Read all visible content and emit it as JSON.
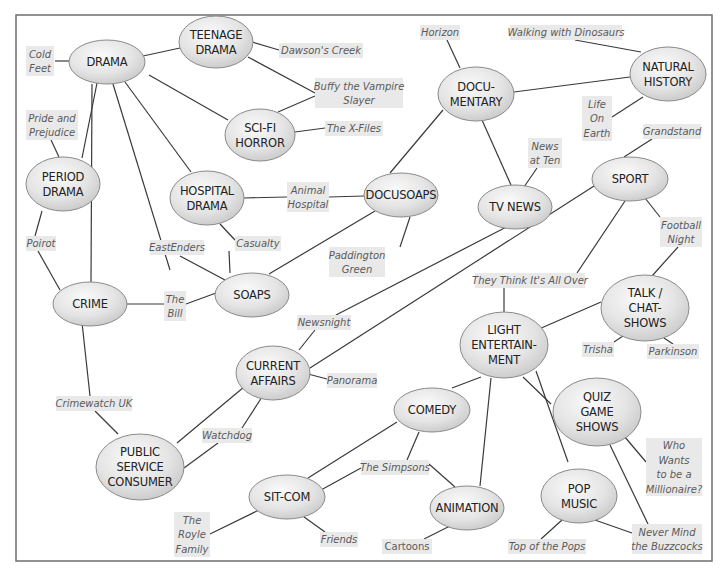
{
  "colors": {
    "frame": "#6e6e6e",
    "edge": "#3a3a3a",
    "node_light": "#fafafa",
    "node_dark": "#c8c8c8",
    "example_box": "#e9e9e9",
    "example_text": "#5a5a5a",
    "node_text": "#222222"
  },
  "frame": {
    "x": 16,
    "y": 15,
    "w": 696,
    "h": 546
  },
  "nodes": [
    {
      "id": "drama",
      "lines": [
        "DRAMA"
      ],
      "cx": 107,
      "cy": 62,
      "rx": 38,
      "ry": 22
    },
    {
      "id": "teenage-drama",
      "lines": [
        "TEENAGE",
        "DRAMA"
      ],
      "cx": 216,
      "cy": 42,
      "rx": 37,
      "ry": 26
    },
    {
      "id": "sci-fi-horror",
      "lines": [
        "SCI-FI",
        "HORROR"
      ],
      "cx": 260,
      "cy": 135,
      "rx": 35,
      "ry": 26
    },
    {
      "id": "period-drama",
      "lines": [
        "PERIOD",
        "DRAMA"
      ],
      "cx": 63,
      "cy": 184,
      "rx": 37,
      "ry": 27
    },
    {
      "id": "hospital-drama",
      "lines": [
        "HOSPITAL",
        "DRAMA"
      ],
      "cx": 207,
      "cy": 198,
      "rx": 37,
      "ry": 27
    },
    {
      "id": "docusoaps",
      "lines": [
        "DOCUSOAPS"
      ],
      "cx": 401,
      "cy": 195,
      "rx": 37,
      "ry": 22
    },
    {
      "id": "crime",
      "lines": [
        "CRIME"
      ],
      "cx": 90,
      "cy": 304,
      "rx": 37,
      "ry": 22
    },
    {
      "id": "soaps",
      "lines": [
        "SOAPS"
      ],
      "cx": 252,
      "cy": 295,
      "rx": 37,
      "ry": 22
    },
    {
      "id": "documentary",
      "lines": [
        "DOCU-",
        "MENTARY"
      ],
      "cx": 476,
      "cy": 94,
      "rx": 38,
      "ry": 27
    },
    {
      "id": "natural-history",
      "lines": [
        "NATURAL",
        "HISTORY"
      ],
      "cx": 668,
      "cy": 74,
      "rx": 38,
      "ry": 27
    },
    {
      "id": "tv-news",
      "lines": [
        "TV NEWS"
      ],
      "cx": 515,
      "cy": 207,
      "rx": 37,
      "ry": 22
    },
    {
      "id": "sport",
      "lines": [
        "SPORT"
      ],
      "cx": 630,
      "cy": 179,
      "rx": 38,
      "ry": 22
    },
    {
      "id": "talk-chat-shows",
      "lines": [
        "TALK /",
        "CHAT-",
        "SHOWS"
      ],
      "cx": 645,
      "cy": 308,
      "rx": 44,
      "ry": 33
    },
    {
      "id": "light-entertainment",
      "lines": [
        "LIGHT",
        "ENTERTAIN-",
        "MENT"
      ],
      "cx": 504,
      "cy": 345,
      "rx": 44,
      "ry": 33
    },
    {
      "id": "current-affairs",
      "lines": [
        "CURRENT",
        "AFFAIRS"
      ],
      "cx": 273,
      "cy": 373,
      "rx": 37,
      "ry": 27
    },
    {
      "id": "comedy",
      "lines": [
        "COMEDY"
      ],
      "cx": 432,
      "cy": 410,
      "rx": 38,
      "ry": 22
    },
    {
      "id": "quiz-game-shows",
      "lines": [
        "QUIZ",
        "GAME",
        "SHOWS"
      ],
      "cx": 597,
      "cy": 412,
      "rx": 44,
      "ry": 34
    },
    {
      "id": "public-service-consumer",
      "lines": [
        "PUBLIC",
        "SERVICE",
        "CONSUMER"
      ],
      "cx": 140,
      "cy": 467,
      "rx": 44,
      "ry": 33
    },
    {
      "id": "sit-com",
      "lines": [
        "SIT-COM"
      ],
      "cx": 287,
      "cy": 497,
      "rx": 38,
      "ry": 22
    },
    {
      "id": "animation",
      "lines": [
        "ANIMATION"
      ],
      "cx": 467,
      "cy": 508,
      "rx": 37,
      "ry": 22
    },
    {
      "id": "pop-music",
      "lines": [
        "POP",
        "MUSIC"
      ],
      "cx": 579,
      "cy": 496,
      "rx": 38,
      "ry": 27
    }
  ],
  "examples": [
    {
      "id": "cold-feet",
      "lines": [
        "Cold",
        "Feet"
      ],
      "x": 26,
      "y": 46,
      "w": 28,
      "h": 30
    },
    {
      "id": "pride-and-prejudice",
      "lines": [
        "Pride and",
        "Prejudice"
      ],
      "x": 26,
      "y": 110,
      "w": 52,
      "h": 30
    },
    {
      "id": "poirot",
      "lines": [
        "Poirot"
      ],
      "x": 26,
      "y": 236,
      "w": 30,
      "h": 15
    },
    {
      "id": "dawsons-creek",
      "lines": [
        "Dawson's Creek"
      ],
      "x": 279,
      "y": 43,
      "w": 84,
      "h": 15
    },
    {
      "id": "buffy-the-vampire-slayer",
      "lines": [
        "Buffy the Vampire",
        "Slayer"
      ],
      "x": 315,
      "y": 78,
      "w": 88,
      "h": 30
    },
    {
      "id": "the-x-files",
      "lines": [
        "The X-Files"
      ],
      "x": 325,
      "y": 121,
      "w": 58,
      "h": 15
    },
    {
      "id": "eastenders",
      "lines": [
        "EastEnders"
      ],
      "x": 150,
      "y": 240,
      "w": 54,
      "h": 15
    },
    {
      "id": "casualty",
      "lines": [
        "Casualty"
      ],
      "x": 235,
      "y": 236,
      "w": 46,
      "h": 15
    },
    {
      "id": "animal-hospital",
      "lines": [
        "Animal",
        "Hospital"
      ],
      "x": 287,
      "y": 182,
      "w": 42,
      "h": 30
    },
    {
      "id": "paddington-green",
      "lines": [
        "Paddington",
        "Green"
      ],
      "x": 329,
      "y": 247,
      "w": 56,
      "h": 30
    },
    {
      "id": "the-bill",
      "lines": [
        "The",
        "Bill"
      ],
      "x": 164,
      "y": 291,
      "w": 22,
      "h": 30
    },
    {
      "id": "horizon",
      "lines": [
        "Horizon"
      ],
      "x": 420,
      "y": 25,
      "w": 40,
      "h": 15
    },
    {
      "id": "walking-with-dinosaurs",
      "lines": [
        "Walking with Dinosaurs"
      ],
      "x": 510,
      "y": 25,
      "w": 112,
      "h": 15
    },
    {
      "id": "life-on-earth",
      "lines": [
        "Life",
        "On",
        "Earth"
      ],
      "x": 582,
      "y": 96,
      "w": 30,
      "h": 45
    },
    {
      "id": "news-at-ten",
      "lines": [
        "News",
        "at Ten"
      ],
      "x": 528,
      "y": 138,
      "w": 34,
      "h": 30
    },
    {
      "id": "grandstand",
      "lines": [
        "Grandstand"
      ],
      "x": 643,
      "y": 124,
      "w": 58,
      "h": 15
    },
    {
      "id": "football-night",
      "lines": [
        "Football",
        "Night"
      ],
      "x": 660,
      "y": 217,
      "w": 42,
      "h": 30
    },
    {
      "id": "newsnight",
      "lines": [
        "Newsnight"
      ],
      "x": 297,
      "y": 315,
      "w": 54,
      "h": 15
    },
    {
      "id": "they-think-its-all-over",
      "lines": [
        "They Think It's All Over"
      ],
      "x": 475,
      "y": 273,
      "w": 110,
      "h": 15
    },
    {
      "id": "trisha",
      "lines": [
        "Trisha"
      ],
      "x": 582,
      "y": 342,
      "w": 32,
      "h": 15
    },
    {
      "id": "parkinson",
      "lines": [
        "Parkinson"
      ],
      "x": 647,
      "y": 344,
      "w": 52,
      "h": 15
    },
    {
      "id": "panorama",
      "lines": [
        "Panorama"
      ],
      "x": 327,
      "y": 373,
      "w": 50,
      "h": 15
    },
    {
      "id": "crimewatch-uk",
      "lines": [
        "Crimewatch UK"
      ],
      "x": 56,
      "y": 396,
      "w": 76,
      "h": 15
    },
    {
      "id": "watchdog",
      "lines": [
        "Watchdog"
      ],
      "x": 202,
      "y": 428,
      "w": 50,
      "h": 15
    },
    {
      "id": "the-simpsons",
      "lines": [
        "The Simpsons"
      ],
      "x": 361,
      "y": 460,
      "w": 68,
      "h": 15
    },
    {
      "id": "who-wants-to-be-a-millionaire",
      "lines": [
        "Who",
        "Wants",
        "to be a",
        "Millionaire?"
      ],
      "x": 646,
      "y": 438,
      "w": 56,
      "h": 58
    },
    {
      "id": "the-royle-family",
      "lines": [
        "The",
        "Royle",
        "Family"
      ],
      "x": 174,
      "y": 512,
      "w": 36,
      "h": 45
    },
    {
      "id": "friends",
      "lines": [
        "Friends"
      ],
      "x": 320,
      "y": 532,
      "w": 38,
      "h": 15
    },
    {
      "id": "cartoons",
      "lines": [
        "Cartoons"
      ],
      "x": 382,
      "y": 539,
      "w": 50,
      "h": 15,
      "upright": true
    },
    {
      "id": "top-of-the-pops",
      "lines": [
        "Top of the Pops"
      ],
      "x": 508,
      "y": 539,
      "w": 78,
      "h": 15
    },
    {
      "id": "never-mind-the-buzzcocks",
      "lines": [
        "Never Mind",
        "the Buzzcocks"
      ],
      "x": 632,
      "y": 524,
      "w": 70,
      "h": 30
    }
  ],
  "edges": [
    [
      55,
      61,
      69,
      61
    ],
    [
      143,
      56,
      180,
      48
    ],
    [
      149,
      75,
      228,
      120
    ],
    [
      97,
      83,
      82,
      158
    ],
    [
      92,
      84,
      91,
      282
    ],
    [
      113,
      84,
      170,
      270
    ],
    [
      125,
      82,
      191,
      172
    ],
    [
      51,
      140,
      59,
      157
    ],
    [
      252,
      42,
      279,
      50
    ],
    [
      248,
      57,
      315,
      93
    ],
    [
      278,
      112,
      315,
      96
    ],
    [
      295,
      132,
      325,
      128
    ],
    [
      42,
      211,
      35,
      236
    ],
    [
      38,
      251,
      60,
      290
    ],
    [
      244,
      198,
      287,
      197
    ],
    [
      329,
      197,
      364,
      196
    ],
    [
      220,
      224,
      235,
      240
    ],
    [
      229,
      251,
      230,
      273
    ],
    [
      180,
      256,
      225,
      280
    ],
    [
      127,
      304,
      164,
      304
    ],
    [
      186,
      304,
      216,
      293
    ],
    [
      269,
      274,
      375,
      211
    ],
    [
      410,
      217,
      400,
      247
    ],
    [
      390,
      173,
      443,
      110
    ],
    [
      447,
      40,
      460,
      68
    ],
    [
      575,
      40,
      641,
      52
    ],
    [
      514,
      92,
      630,
      77
    ],
    [
      612,
      117,
      643,
      97
    ],
    [
      482,
      120,
      511,
      185
    ],
    [
      524,
      187,
      537,
      168
    ],
    [
      652,
      139,
      624,
      157
    ],
    [
      625,
      201,
      577,
      273
    ],
    [
      645,
      198,
      660,
      217
    ],
    [
      678,
      247,
      652,
      276
    ],
    [
      539,
      329,
      601,
      302
    ],
    [
      504,
      288,
      504,
      312
    ],
    [
      623,
      336,
      614,
      342
    ],
    [
      664,
      338,
      673,
      344
    ],
    [
      520,
      220,
      336,
      315
    ],
    [
      594,
      186,
      310,
      368
    ],
    [
      315,
      330,
      299,
      350
    ],
    [
      308,
      374,
      327,
      379
    ],
    [
      262,
      397,
      242,
      428
    ],
    [
      218,
      443,
      184,
      468
    ],
    [
      80,
      304,
      90,
      396
    ],
    [
      95,
      411,
      118,
      434
    ],
    [
      244,
      387,
      177,
      443
    ],
    [
      481,
      377,
      452,
      388
    ],
    [
      523,
      377,
      551,
      404
    ],
    [
      536,
      371,
      568,
      462
    ],
    [
      491,
      378,
      480,
      486
    ],
    [
      419,
      432,
      407,
      460
    ],
    [
      397,
      422,
      308,
      478
    ],
    [
      429,
      464,
      455,
      487
    ],
    [
      321,
      490,
      361,
      468
    ],
    [
      619,
      430,
      646,
      462
    ],
    [
      610,
      445,
      648,
      524
    ],
    [
      592,
      519,
      632,
      533
    ],
    [
      562,
      520,
      541,
      539
    ],
    [
      452,
      525,
      424,
      539
    ],
    [
      259,
      510,
      210,
      534
    ],
    [
      304,
      517,
      325,
      532
    ]
  ]
}
